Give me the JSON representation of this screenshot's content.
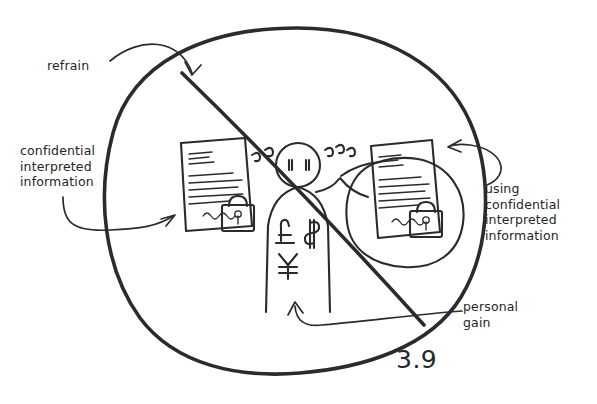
{
  "figure": {
    "number": "3.9",
    "ink_color": "#2b2b2b",
    "background_color": "#ffffff",
    "style": "hand-drawn sketch",
    "meaning": "prohibition sign: a circle with a diagonal slash over the depicted behaviour"
  },
  "annotations": {
    "refrain": "refrain",
    "left_note": "confidential\ninterpreted\ninformation",
    "right_note": "using\nconfidential\ninterpreted\ninformation",
    "personal_gain": "personal\ngain"
  },
  "scene": {
    "person": {
      "name": "person-figure",
      "eyes": 2,
      "motion_marks_left": 2,
      "motion_marks_right": 3
    },
    "currency_symbols": [
      "£",
      "$",
      "¥"
    ],
    "documents": [
      {
        "name": "confidential-document-left",
        "has_lock": true,
        "has_signature_squiggle": true,
        "text_lines": 9
      },
      {
        "name": "confidential-document-right",
        "has_lock": true,
        "has_signature_squiggle": true,
        "text_lines": 9
      }
    ],
    "speech_bubble": {
      "name": "speech-bubble",
      "contains": "confidential-document-right"
    }
  }
}
